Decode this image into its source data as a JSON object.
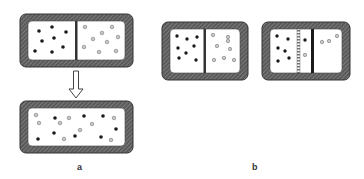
{
  "figure": {
    "labels": {
      "a": "a",
      "b": "b"
    },
    "colors": {
      "wall": "#5a5a5a",
      "wall_hatch": "#8a8a8a",
      "interior": "#ffffff",
      "black_particle": "#1a1a1a",
      "gray_particle": "#b8b8b8",
      "divider": "#333333"
    },
    "panel_a": {
      "description": "Container with partition separating black and gray particles; after partition removal particles mix",
      "top": {
        "partition": "removable wall",
        "left_particles": "black",
        "right_particles": "gray"
      },
      "arrow": "down-arrow",
      "bottom": {
        "partition": "none",
        "particles": "mixed"
      }
    },
    "panel_b": {
      "description": "Semipermeable membranes: sequence of four containers",
      "frames": [
        {
          "id": "b1",
          "membranes": "single solid wall"
        },
        {
          "id": "b2",
          "membranes": "porous (striped) wall + solid wall"
        },
        {
          "id": "b3",
          "membranes": "porous wall + solid wall, mixing in middle"
        },
        {
          "id": "b4",
          "membranes": "porous wall moved left, solid wall moved right"
        }
      ]
    }
  }
}
